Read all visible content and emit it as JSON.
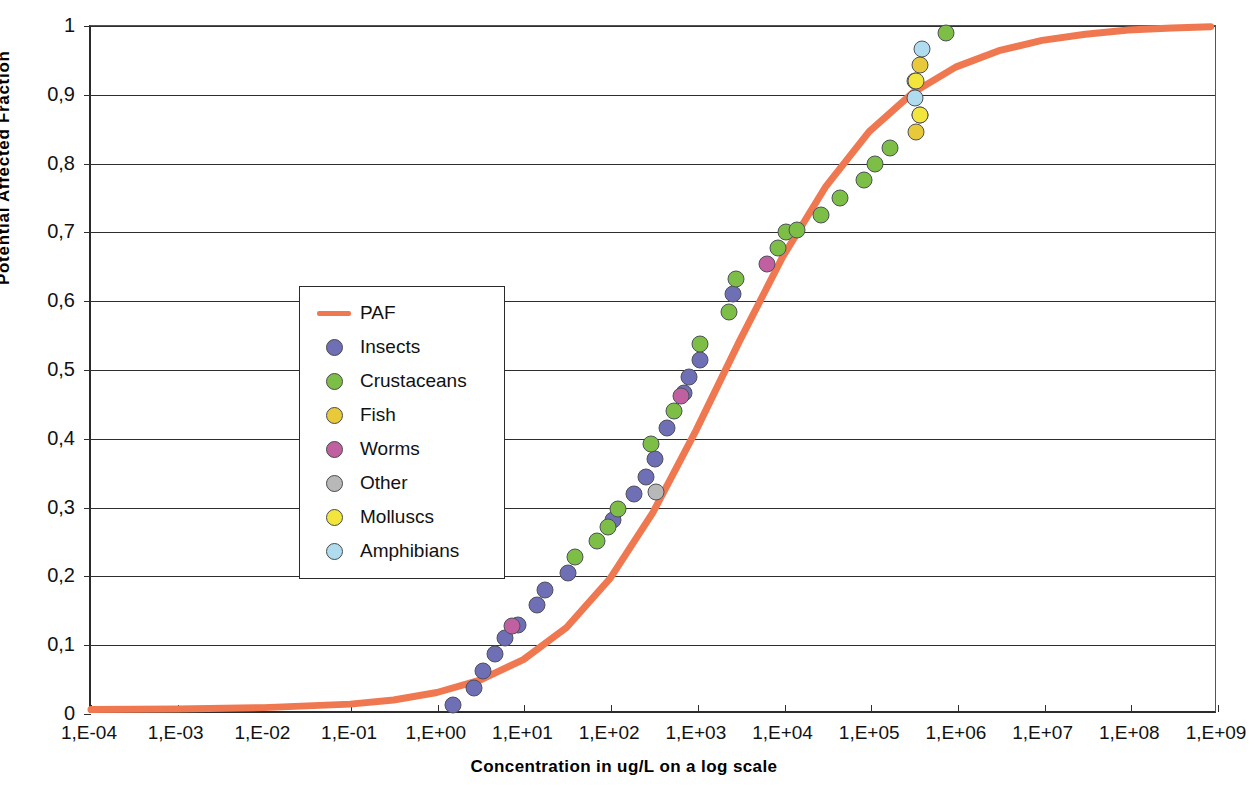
{
  "chart_data": {
    "type": "scatter",
    "title": "",
    "xlabel": "Concentration in ug/L on a log scale",
    "ylabel": "Potential Affected Fraction",
    "grid": true,
    "legend_position": "inside-left",
    "x_log": true,
    "xlim": [
      -4,
      9
    ],
    "ylim": [
      0,
      1
    ],
    "x_tick_labels": [
      "1,E-04",
      "1,E-03",
      "1,E-02",
      "1,E-01",
      "1,E+00",
      "1,E+01",
      "1,E+02",
      "1,E+03",
      "1,E+04",
      "1,E+05",
      "1,E+06",
      "1,E+07",
      "1,E+08",
      "1,E+09"
    ],
    "x_tick_exponents": [
      -4,
      -3,
      -2,
      -1,
      0,
      1,
      2,
      3,
      4,
      5,
      6,
      7,
      8,
      9
    ],
    "y_tick_labels": [
      "0",
      "0,1",
      "0,2",
      "0,3",
      "0,4",
      "0,5",
      "0,6",
      "0,7",
      "0,8",
      "0,9",
      "1"
    ],
    "y_tick_values": [
      0,
      0.1,
      0.2,
      0.3,
      0.4,
      0.5,
      0.6,
      0.7,
      0.8,
      0.9,
      1
    ],
    "curve": {
      "name": "PAF",
      "color": "#F07850",
      "points": [
        {
          "logx": -4.0,
          "y": 0.002
        },
        {
          "logx": -3.0,
          "y": 0.003
        },
        {
          "logx": -2.0,
          "y": 0.005
        },
        {
          "logx": -1.0,
          "y": 0.01
        },
        {
          "logx": -0.5,
          "y": 0.016
        },
        {
          "logx": 0.0,
          "y": 0.027
        },
        {
          "logx": 0.5,
          "y": 0.045
        },
        {
          "logx": 1.0,
          "y": 0.075
        },
        {
          "logx": 1.5,
          "y": 0.122
        },
        {
          "logx": 2.0,
          "y": 0.193
        },
        {
          "logx": 2.5,
          "y": 0.29
        },
        {
          "logx": 3.0,
          "y": 0.41
        },
        {
          "logx": 3.5,
          "y": 0.54
        },
        {
          "logx": 4.0,
          "y": 0.663
        },
        {
          "logx": 4.5,
          "y": 0.766
        },
        {
          "logx": 5.0,
          "y": 0.846
        },
        {
          "logx": 5.5,
          "y": 0.902
        },
        {
          "logx": 6.0,
          "y": 0.94
        },
        {
          "logx": 6.5,
          "y": 0.964
        },
        {
          "logx": 7.0,
          "y": 0.979
        },
        {
          "logx": 7.5,
          "y": 0.988
        },
        {
          "logx": 8.0,
          "y": 0.994
        },
        {
          "logx": 8.5,
          "y": 0.997
        },
        {
          "logx": 8.95,
          "y": 0.999
        }
      ]
    },
    "series": [
      {
        "name": "Insects",
        "color": "#6E6FB5",
        "points": [
          {
            "logx": 0.18,
            "y": 0.013
          },
          {
            "logx": 0.42,
            "y": 0.038
          },
          {
            "logx": 0.52,
            "y": 0.062
          },
          {
            "logx": 0.66,
            "y": 0.087
          },
          {
            "logx": 0.78,
            "y": 0.11
          },
          {
            "logx": 0.92,
            "y": 0.13
          },
          {
            "logx": 1.14,
            "y": 0.158
          },
          {
            "logx": 1.24,
            "y": 0.18
          },
          {
            "logx": 1.5,
            "y": 0.205
          },
          {
            "logx": 2.02,
            "y": 0.282
          },
          {
            "logx": 2.26,
            "y": 0.32
          },
          {
            "logx": 2.4,
            "y": 0.345
          },
          {
            "logx": 2.5,
            "y": 0.37
          },
          {
            "logx": 2.64,
            "y": 0.416
          },
          {
            "logx": 2.84,
            "y": 0.466
          },
          {
            "logx": 2.9,
            "y": 0.49
          },
          {
            "logx": 3.02,
            "y": 0.514
          },
          {
            "logx": 3.4,
            "y": 0.61
          }
        ]
      },
      {
        "name": "Crustaceans",
        "color": "#7DBE46",
        "points": [
          {
            "logx": 1.58,
            "y": 0.228
          },
          {
            "logx": 1.84,
            "y": 0.251
          },
          {
            "logx": 1.96,
            "y": 0.272
          },
          {
            "logx": 2.08,
            "y": 0.298
          },
          {
            "logx": 2.46,
            "y": 0.392
          },
          {
            "logx": 2.72,
            "y": 0.44
          },
          {
            "logx": 3.02,
            "y": 0.538
          },
          {
            "logx": 3.36,
            "y": 0.585
          },
          {
            "logx": 3.44,
            "y": 0.632
          },
          {
            "logx": 3.92,
            "y": 0.678
          },
          {
            "logx": 4.02,
            "y": 0.701
          },
          {
            "logx": 4.14,
            "y": 0.703
          },
          {
            "logx": 4.42,
            "y": 0.726
          },
          {
            "logx": 4.64,
            "y": 0.75
          },
          {
            "logx": 4.92,
            "y": 0.776
          },
          {
            "logx": 5.04,
            "y": 0.8
          },
          {
            "logx": 5.22,
            "y": 0.822
          },
          {
            "logx": 5.86,
            "y": 0.99
          }
        ]
      },
      {
        "name": "Fish",
        "color": "#E8C93A",
        "points": [
          {
            "logx": 5.52,
            "y": 0.846
          },
          {
            "logx": 5.56,
            "y": 0.87
          },
          {
            "logx": 5.5,
            "y": 0.92
          },
          {
            "logx": 5.56,
            "y": 0.944
          }
        ]
      },
      {
        "name": "Worms",
        "color": "#C060A0",
        "points": [
          {
            "logx": 0.86,
            "y": 0.128
          },
          {
            "logx": 2.8,
            "y": 0.462
          },
          {
            "logx": 3.8,
            "y": 0.654
          }
        ]
      },
      {
        "name": "Other",
        "color": "#B8B8B8",
        "points": [
          {
            "logx": 2.52,
            "y": 0.322
          }
        ]
      },
      {
        "name": "Molluscs",
        "color": "#F2E63C",
        "points": [
          {
            "logx": 5.56,
            "y": 0.87
          },
          {
            "logx": 5.52,
            "y": 0.92
          }
        ]
      },
      {
        "name": "Amphibians",
        "color": "#AFDCEF",
        "points": [
          {
            "logx": 5.5,
            "y": 0.895
          },
          {
            "logx": 5.58,
            "y": 0.966
          }
        ]
      }
    ]
  },
  "legend": {
    "items": [
      {
        "label": "PAF",
        "marker": "line",
        "color": "#F07850"
      },
      {
        "label": "Insects",
        "marker": "dot",
        "color": "#6E6FB5"
      },
      {
        "label": "Crustaceans",
        "marker": "dot",
        "color": "#7DBE46"
      },
      {
        "label": "Fish",
        "marker": "dot",
        "color": "#E8C93A"
      },
      {
        "label": "Worms",
        "marker": "dot",
        "color": "#C060A0"
      },
      {
        "label": "Other",
        "marker": "dot",
        "color": "#B8B8B8"
      },
      {
        "label": "Molluscs",
        "marker": "dot",
        "color": "#F2E63C"
      },
      {
        "label": "Amphibians",
        "marker": "dot",
        "color": "#AFDCEF"
      }
    ]
  }
}
